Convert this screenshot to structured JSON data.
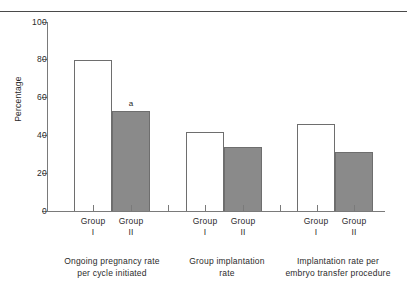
{
  "chart_data": {
    "type": "bar",
    "title": "",
    "subtitle": "",
    "xlabel": "",
    "ylabel": "Percentage",
    "ylim": [
      0,
      100
    ],
    "ytick_labels": [
      "0",
      "20",
      "40",
      "60",
      "80",
      "100"
    ],
    "ytick_values": [
      0,
      20,
      40,
      60,
      80,
      100
    ],
    "grid": false,
    "legend": null,
    "categories": [
      "Ongoing pregnancy rate per cycle initiated",
      "Group implantation rate",
      "Implantation rate per embryo transfer procedure"
    ],
    "group_captions": [
      {
        "line1": "Ongoing pregnancy rate",
        "line2": "per cycle initiated"
      },
      {
        "line1": "Group implantation",
        "line2": "rate"
      },
      {
        "line1": "Implantation rate per",
        "line2": "embryo transfer procedure"
      }
    ],
    "series": [
      {
        "name": "Group I",
        "values": [
          80,
          42,
          46
        ],
        "fill": "#ffffff"
      },
      {
        "name": "Group II",
        "values": [
          53,
          34,
          31
        ],
        "fill": "#8a8a8a"
      }
    ],
    "bars": [
      {
        "group": 0,
        "series": "Group I",
        "label_line1": "Group",
        "label_line2": "I",
        "value": 80,
        "style": "open",
        "annotation": ""
      },
      {
        "group": 0,
        "series": "Group II",
        "label_line1": "Group",
        "label_line2": "II",
        "value": 53,
        "style": "filled",
        "annotation": "a"
      },
      {
        "group": 1,
        "series": "Group I",
        "label_line1": "Group",
        "label_line2": "I",
        "value": 42,
        "style": "open",
        "annotation": ""
      },
      {
        "group": 1,
        "series": "Group II",
        "label_line1": "Group",
        "label_line2": "II",
        "value": 34,
        "style": "filled",
        "annotation": ""
      },
      {
        "group": 2,
        "series": "Group I",
        "label_line1": "Group",
        "label_line2": "I",
        "value": 46,
        "style": "open",
        "annotation": ""
      },
      {
        "group": 2,
        "series": "Group II",
        "label_line1": "Group",
        "label_line2": "II",
        "value": 31,
        "style": "filled",
        "annotation": ""
      }
    ],
    "colors": {
      "open_bar_fill": "#ffffff",
      "filled_bar_fill": "#8a8a8a",
      "bar_outline": "#6e6e6e",
      "axis": "#7a7a7a",
      "text": "#2b2b2b",
      "rule": "#4a4a4a"
    }
  }
}
